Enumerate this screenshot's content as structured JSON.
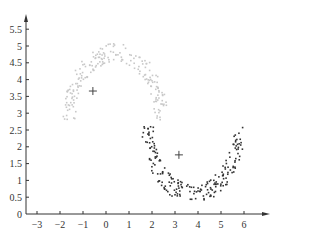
{
  "chart_data": {
    "type": "scatter",
    "title": "",
    "xlabel": "",
    "ylabel": "",
    "xlim": [
      -3.5,
      7.0
    ],
    "ylim": [
      0,
      5.8
    ],
    "grid": false,
    "legend": "none",
    "x_ticks": [
      -3,
      -2,
      -1,
      0,
      1,
      2,
      3,
      4,
      5,
      6
    ],
    "x_tick_labels": [
      "−3",
      "−2",
      "−1",
      "0",
      "1",
      "2",
      "3",
      "4",
      "5",
      "6"
    ],
    "y_ticks": [
      0,
      0.5,
      1,
      1.5,
      2,
      2.5,
      3,
      3.5,
      4,
      4.5,
      5,
      5.5
    ],
    "y_tick_labels": [
      "0",
      "0.5",
      "1",
      "1.5",
      "2",
      "2.5",
      "3",
      "3.5",
      "4",
      "4.5",
      "5",
      "5.5"
    ],
    "series": [
      {
        "name": "cluster-1 (upper moon)",
        "color": "#c8c8c8",
        "shape": "arc",
        "center": [
          0.4,
          2.8
        ],
        "radius": 2.0,
        "angle_range_deg": [
          0,
          180
        ],
        "thickness": 0.55,
        "n_points": 200,
        "x_range": [
          -2.8,
          2.6
        ],
        "y_range": [
          1.6,
          5.0
        ]
      },
      {
        "name": "cluster-2 (lower moon)",
        "color": "#333333",
        "shape": "arc",
        "center": [
          3.8,
          2.6
        ],
        "radius": 2.0,
        "angle_range_deg": [
          180,
          360
        ],
        "thickness": 0.55,
        "n_points": 200,
        "x_range": [
          1.4,
          6.0
        ],
        "y_range": [
          0.5,
          3.9
        ]
      }
    ],
    "centroids": [
      {
        "name": "centroid-1",
        "x": -0.57,
        "y": 3.66,
        "marker": "+"
      },
      {
        "name": "centroid-2",
        "x": 3.17,
        "y": 1.76,
        "marker": "+"
      }
    ]
  },
  "axes": {
    "origin_px": [
      106,
      214
    ],
    "x_unit_px": 23,
    "y_unit_px": 33.6,
    "y_axis_x_px": 26,
    "x_axis_end_px": 270,
    "y_axis_top_px": 14
  }
}
